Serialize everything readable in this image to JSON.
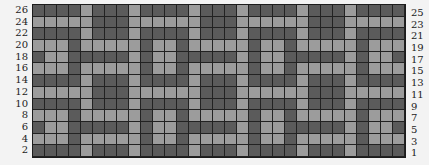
{
  "chart": {
    "title": "",
    "colors": {
      "dark": "#5b5b5b",
      "light": "#9c9c9c",
      "gridline": "#1c1c1c",
      "background": "#f3f3f3"
    },
    "columns": 31,
    "rows_count": 13,
    "left_labels": [
      "26",
      "24",
      "22",
      "20",
      "18",
      "16",
      "14",
      "12",
      "10",
      "8",
      "6",
      "4",
      "2"
    ],
    "right_labels": [
      "25",
      "23",
      "21",
      "19",
      "17",
      "15",
      "13",
      "11",
      "9",
      "7",
      "5",
      "3",
      "1"
    ],
    "legend": {
      "D": "dark square",
      "L": "light square"
    },
    "rows": [
      "DDDDLDDDLDDDDLDDDLDDDDLDDDLDDDD",
      "LLLLLDDDLLLLLLDDDLLLLLLDDDLLLLL",
      "DDDDLDDDLDDDDLDDDLDDDDLDDDLDDDD",
      "LLLDLLLLLDLLDLLLLLDLLDLLLLLDLLL",
      "DLLDDDDDLDLLDDDDDLDLLDDDDDLDLLD",
      "LLLDLLLLLDLLDLLLLLDLLDLLLLLDLLL",
      "DDDDLDDDLDDDDLDDDLDDDDLDDDLDDDD",
      "LLLLLDDDLLLLLLDDDLLLLLLDDDLLLLL",
      "DDDDLDDDLDDDDLDDDLDDDDLDDDLDDDD",
      "LLLDLLLLLDLLDLLLLLDLLDLLLLLDLLL",
      "DLLDDDDDLDLLDDDDDLDLLDDDDDLDLLD",
      "LLLDLLLLLDLLDLLLLLDLLDLLLLLDLLL",
      "DDDDLDDDLDDDDLDDDLDDDDLDDDLDDDD"
    ]
  },
  "chart_data": {
    "type": "heatmap",
    "title": "",
    "xlabel": "",
    "ylabel": "",
    "x": [
      1,
      2,
      3,
      4,
      5,
      6,
      7,
      8,
      9,
      10,
      11,
      12,
      13,
      14,
      15,
      16,
      17,
      18,
      19,
      20,
      21,
      22,
      23,
      24,
      25,
      26,
      27,
      28,
      29,
      30,
      31
    ],
    "y_left_labels": [
      26,
      24,
      22,
      20,
      18,
      16,
      14,
      12,
      10,
      8,
      6,
      4,
      2
    ],
    "y_right_labels": [
      25,
      23,
      21,
      19,
      17,
      15,
      13,
      11,
      9,
      7,
      5,
      3,
      1
    ],
    "values_legend": {
      "1": "dark",
      "0": "light"
    },
    "grid": true,
    "legend_position": "none",
    "rows": [
      "DDDDLDDDLDDDDLDDDLDDDDLDDDLDDDD",
      "LLLLLDDDLLLLLLDDDLLLLLLDDDLLLLL",
      "DDDDLDDDLDDDDLDDDLDDDDLDDDLDDDD",
      "LLLDLLLLLDLLDLLLLLDLLDLLLLLDLLL",
      "DLLDDDDDLDLLDDDDDLDLLDDDDDLDLLD",
      "LLLDLLLLLDLLDLLLLLDLLDLLLLLDLLL",
      "DDDDLDDDLDDDDLDDDLDDDDLDDDLDDDD",
      "LLLLLDDDLLLLLLDDDLLLLLLDDDLLLLL",
      "DDDDLDDDLDDDDLDDDLDDDDLDDDLDDDD",
      "LLLDLLLLLDLLDLLLLLDLLDLLLLLDLLL",
      "DLLDDDDDLDLLDDDDDLDLLDDDDDLDLLD",
      "LLLDLLLLLDLLDLLLLLDLLDLLLLLDLLL",
      "DDDDLDDDLDDDDLDDDLDDDDLDDDLDDDD"
    ]
  }
}
